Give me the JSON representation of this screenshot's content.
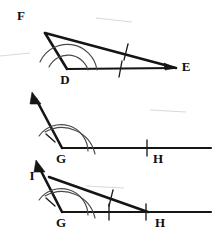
{
  "figure": {
    "background_color": "#ffffff",
    "ink_color": "#151515",
    "arc_color": "#4a4a4a",
    "width": 220,
    "height": 240,
    "panel_count": 3
  },
  "labels": {
    "top_F": "F",
    "top_D": "D",
    "top_E": "E",
    "middle_G": "G",
    "middle_H": "H",
    "bottom_I": "I",
    "bottom_G": "G",
    "bottom_H": "H"
  },
  "panels": [
    {
      "name": "given-triangle",
      "vertices": [
        "F",
        "D",
        "E"
      ],
      "marked_angle_at": "D",
      "angle_arc_count": 2,
      "tick_marked_sides": [
        "DE",
        "FE"
      ],
      "tick_count_per_side": 1
    },
    {
      "name": "copied-angle",
      "vertices": [
        "G",
        "H"
      ],
      "marked_angle_at": "G",
      "angle_arc_count": 2,
      "tick_marked_sides": [
        "GH"
      ],
      "tick_count_per_side": 1,
      "has_ray_arrow": true
    },
    {
      "name": "completed-triangle",
      "vertices": [
        "I",
        "G",
        "H"
      ],
      "marked_angle_at": "G",
      "angle_arc_count": 2,
      "tick_marked_sides": [
        "GH",
        "IH"
      ],
      "tick_count_per_side": 1,
      "has_ray_arrow": true
    }
  ],
  "geometry": {
    "top": {
      "F": [
        45,
        33
      ],
      "D": [
        67,
        69
      ],
      "E": [
        176,
        68
      ],
      "F_label_pos": [
        21,
        17
      ],
      "D_label_pos": [
        65,
        80
      ],
      "E_label_pos": [
        186,
        68
      ]
    },
    "middle": {
      "G": [
        62,
        148
      ],
      "ray_tip": [
        32,
        92
      ],
      "H_end": [
        211,
        148
      ],
      "G_label_pos": [
        61,
        159
      ],
      "H_label_pos": [
        157,
        159
      ],
      "tick_x": 147
    },
    "bottom": {
      "I": [
        49,
        177
      ],
      "G": [
        62,
        212
      ],
      "H": [
        148,
        212
      ],
      "ray_tip": [
        36,
        160
      ],
      "H_end": [
        211,
        212
      ],
      "I_label_pos": [
        32,
        176
      ],
      "G_label_pos": [
        61,
        223
      ],
      "H_label_pos": [
        159,
        223
      ]
    }
  }
}
